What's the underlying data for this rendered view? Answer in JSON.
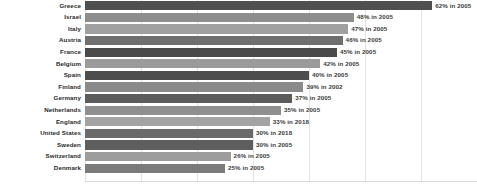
{
  "chart_data": {
    "type": "bar",
    "orientation": "horizontal",
    "title": "",
    "subtitle": "",
    "xlabel": "",
    "ylabel": "",
    "xlim": [
      0,
      70
    ],
    "grid": true,
    "legend": false,
    "gridline_values": [
      0,
      10,
      20,
      30,
      40,
      50,
      60,
      70
    ],
    "categories": [
      "Greece",
      "Israel",
      "Italy",
      "Austria",
      "France",
      "Belgium",
      "Spain",
      "Finland",
      "Germany",
      "Netherlands",
      "England",
      "United States",
      "Sweden",
      "Switzerland",
      "Denmark"
    ],
    "values": [
      62,
      48,
      47,
      46,
      45,
      42,
      40,
      39,
      37,
      35,
      33,
      30,
      30,
      26,
      25
    ],
    "years": [
      2005,
      2005,
      2005,
      2005,
      2005,
      2005,
      2005,
      2002,
      2005,
      2005,
      2018,
      2018,
      2005,
      2005,
      2005
    ],
    "data_labels": [
      "62% in 2005",
      "48% in 2005",
      "47% in 2005",
      "46% in 2005",
      "45% in 2005",
      "42% in 2005",
      "40% in 2005",
      "39% in 2002",
      "37% in 2005",
      "35% in 2005",
      "33% in 2018",
      "30% in 2018",
      "30% in 2005",
      "26% in 2005",
      "25% in 2005"
    ],
    "bar_colors": [
      "#4f4f4f",
      "#8d8d8d",
      "#a0a0a0",
      "#6f6f6f",
      "#4a4a4a",
      "#9b9b9b",
      "#4d4d4d",
      "#8a8a8a",
      "#5c5c5c",
      "#8f8f8f",
      "#a3a3a3",
      "#6a6a6a",
      "#5e5e5e",
      "#9d9d9d",
      "#7b7b7b"
    ]
  },
  "colors": {
    "background": "#ffffff",
    "gridline": "#e2e2e2",
    "label_text": "#2a2a2a",
    "value_text": "#3a3a3a"
  }
}
